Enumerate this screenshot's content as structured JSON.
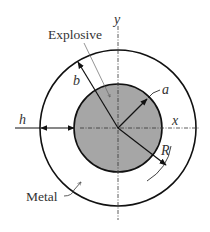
{
  "diagram": {
    "type": "cross-section",
    "labels": {
      "explosive": "Explosive",
      "metal": "Metal",
      "inner_radius": "a",
      "outer_radius": "b",
      "thickness": "h",
      "radial_coord": "R",
      "x_axis": "x",
      "y_axis": "y"
    },
    "colors": {
      "explosive_fill": "#a6a6a6",
      "stroke": "#111111",
      "background": "#ffffff"
    }
  }
}
